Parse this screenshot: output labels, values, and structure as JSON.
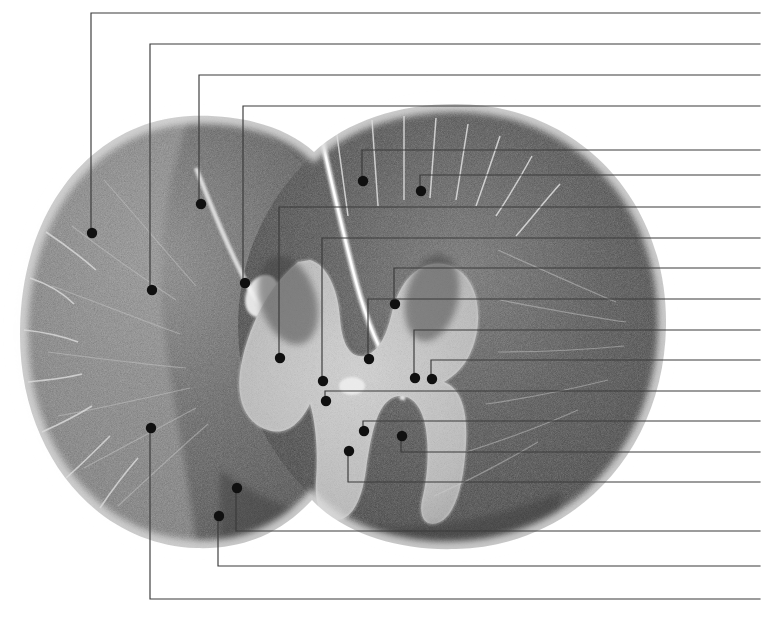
{
  "figure": {
    "stain_appearance": "grayscale myelin stain",
    "canvas": {
      "width": 771,
      "height": 623,
      "background": "#ffffff"
    },
    "colors": {
      "leader_line": "#3a3a3a",
      "callout_dot": "#101010",
      "white_matter_dark": "#4a4a4a",
      "white_matter_mid": "#6e6e6e",
      "gray_matter_light": "#c9c9c9",
      "halo": "#d9d9d9",
      "background": "#ffffff"
    },
    "specimen": {
      "shape": "two overlapping rounded lobes (left and right halves of cord)",
      "bounds": {
        "x": 18,
        "y": 102,
        "width": 648,
        "height": 448
      },
      "left_lobe": {
        "cx": 190,
        "cy": 332,
        "rx": 175,
        "ry": 216
      },
      "right_lobe": {
        "cx": 452,
        "cy": 326,
        "rx": 212,
        "ry": 222
      }
    },
    "right_edge_x": 760,
    "callouts": [
      {
        "id": 1,
        "dot": [
          92,
          233
        ],
        "elbow_x": 91,
        "line_y": 13,
        "label": ""
      },
      {
        "id": 2,
        "dot": [
          152,
          290
        ],
        "elbow_x": 150,
        "line_y": 44,
        "label": ""
      },
      {
        "id": 3,
        "dot": [
          201,
          204
        ],
        "elbow_x": 199,
        "line_y": 75,
        "label": ""
      },
      {
        "id": 4,
        "dot": [
          245,
          283
        ],
        "elbow_x": 243,
        "line_y": 106,
        "label": ""
      },
      {
        "id": 5,
        "dot": [
          363,
          181
        ],
        "elbow_x": 362,
        "line_y": 150,
        "label": ""
      },
      {
        "id": 6,
        "dot": [
          421,
          191
        ],
        "elbow_x": 420,
        "line_y": 175,
        "label": ""
      },
      {
        "id": 7,
        "dot": [
          280,
          358
        ],
        "elbow_x": 279,
        "line_y": 207,
        "label": ""
      },
      {
        "id": 8,
        "dot": [
          323,
          381
        ],
        "elbow_x": 322,
        "line_y": 238,
        "label": ""
      },
      {
        "id": 9,
        "dot": [
          395,
          304
        ],
        "elbow_x": 394,
        "line_y": 268,
        "label": ""
      },
      {
        "id": 10,
        "dot": [
          369,
          359
        ],
        "elbow_x": 368,
        "line_y": 299,
        "label": ""
      },
      {
        "id": 11,
        "dot": [
          415,
          378
        ],
        "elbow_x": 414,
        "line_y": 330,
        "label": ""
      },
      {
        "id": 12,
        "dot": [
          432,
          379
        ],
        "elbow_x": 431,
        "line_y": 360,
        "label": ""
      },
      {
        "id": 13,
        "dot": [
          326,
          401
        ],
        "elbow_x": 325,
        "line_y": 391,
        "label": ""
      },
      {
        "id": 14,
        "dot": [
          364,
          431
        ],
        "elbow_x": 363,
        "line_y": 421,
        "label": ""
      },
      {
        "id": 15,
        "dot": [
          402,
          436
        ],
        "elbow_x": 401,
        "line_y": 452,
        "label": ""
      },
      {
        "id": 16,
        "dot": [
          349,
          451
        ],
        "elbow_x": 348,
        "line_y": 482,
        "label": ""
      },
      {
        "id": 17,
        "dot": [
          237,
          488
        ],
        "elbow_x": 236,
        "line_y": 531,
        "label": ""
      },
      {
        "id": 18,
        "dot": [
          219,
          516
        ],
        "elbow_x": 218,
        "line_y": 566,
        "label": ""
      },
      {
        "id": 19,
        "dot": [
          151,
          428
        ],
        "elbow_x": 150,
        "line_y": 599,
        "label": ""
      }
    ]
  }
}
